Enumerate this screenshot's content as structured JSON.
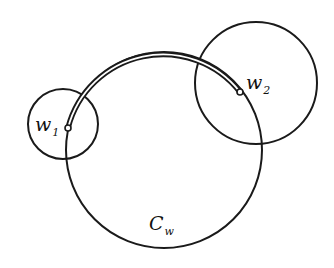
{
  "diagram": {
    "background": "#ffffff",
    "stroke_color": "#1a1a1a",
    "circles": [
      {
        "name": "small-circle-w1",
        "cx": 63,
        "cy": 124,
        "r": 35
      },
      {
        "name": "circle-w2",
        "cx": 256,
        "cy": 83,
        "r": 61
      },
      {
        "name": "circle-Cw",
        "cx": 164,
        "cy": 150,
        "r": 98
      }
    ],
    "arc": {
      "from": "w1",
      "to": "w2",
      "style": "double-line"
    },
    "points": {
      "w1": {
        "x": 68,
        "y": 128
      },
      "w2": {
        "x": 240,
        "y": 92
      }
    },
    "labels": {
      "w1": {
        "main": "w",
        "sub": "1"
      },
      "w2": {
        "main": "w",
        "sub": "2"
      },
      "cw": {
        "main": "C",
        "sub": "w"
      }
    }
  }
}
